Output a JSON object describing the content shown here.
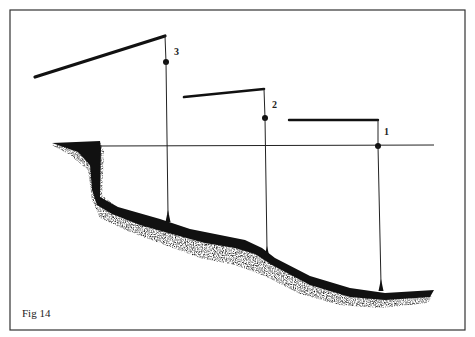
{
  "figure": {
    "caption": "Fig 14",
    "colors": {
      "ink": "#111111",
      "frame": "#333333",
      "background": "#ffffff"
    },
    "markers": [
      {
        "id": "3",
        "label": "3"
      },
      {
        "id": "2",
        "label": "2"
      },
      {
        "id": "1",
        "label": "1"
      }
    ]
  }
}
